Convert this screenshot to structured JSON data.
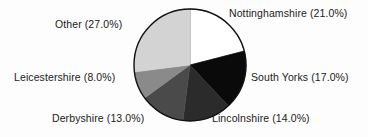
{
  "chart_data": {
    "type": "pie",
    "title": "",
    "categories": [
      "Nottinghamshire",
      "South Yorks",
      "Lincolnshire",
      "Derbyshire",
      "Leicestershire",
      "Other"
    ],
    "values": [
      21.0,
      17.0,
      14.0,
      13.0,
      8.0,
      27.0
    ],
    "units": "percent",
    "start_angle_deg": 0,
    "direction": "clockwise",
    "legend": "none",
    "grid": false,
    "labels": [
      {
        "name": "Nottinghamshire",
        "value": 21.0,
        "text": "Nottinghamshire (21.0%)",
        "color": "#ffffff"
      },
      {
        "name": "South Yorks",
        "value": 17.0,
        "text": "South Yorks (17.0%)",
        "color": "#0a0a0a"
      },
      {
        "name": "Lincolnshire",
        "value": 14.0,
        "text": "Lincolnshire (14.0%)",
        "color": "#2b2b2b"
      },
      {
        "name": "Derbyshire",
        "value": 13.0,
        "text": "Derbyshire (13.0%)",
        "color": "#4a4a4a"
      },
      {
        "name": "Leicestershire",
        "value": 8.0,
        "text": "Leicestershire (8.0%)",
        "color": "#8a8a8a"
      },
      {
        "name": "Other",
        "value": 27.0,
        "text": "Other (27.0%)",
        "color": "#d3d3d3"
      }
    ],
    "geometry": {
      "center_x": 190,
      "center_y": 65,
      "radius": 56,
      "outline_color": "#111111",
      "background": "#fdfdfd"
    }
  }
}
